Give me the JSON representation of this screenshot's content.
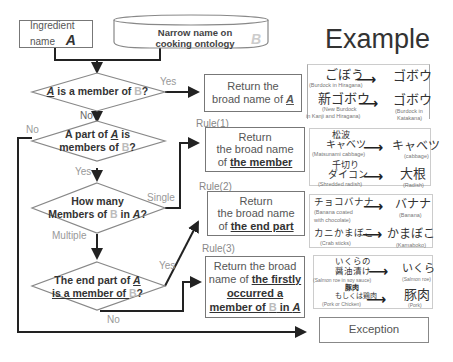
{
  "title": "Example",
  "inputs": {
    "ingredient": {
      "line1": "Ingredient",
      "line2": "name",
      "symbol": "A"
    },
    "ontology": {
      "line1": "Narrow name on",
      "line2": "cooking ontology",
      "symbol": "B"
    }
  },
  "decisions": {
    "d1": {
      "pre": "",
      "a": "A",
      "mid": " is a member of ",
      "b": "B",
      "post": "?"
    },
    "d2": {
      "line1_pre": "A part of ",
      "line1_a": "A",
      "line1_post": " is",
      "line2_pre": "members of ",
      "line2_b": "B",
      "line2_post": "?"
    },
    "d3": {
      "line1": "How many",
      "line2_pre": "Members of ",
      "line2_b": "B",
      "line2_mid": " in ",
      "line2_a": "A",
      "line2_post": "?"
    },
    "d4": {
      "line1_pre": "The end part of ",
      "line1_a": "A",
      "line2_pre": "is a member of ",
      "line2_b": "B",
      "line2_post": "?"
    }
  },
  "edge_labels": {
    "d1_yes": "Yes",
    "d1_no": "No",
    "d2_no": "No",
    "d2_yes": "Yes",
    "d3_single": "Single",
    "d3_multiple": "Multiple",
    "d4_yes": "Yes",
    "d4_no": "No"
  },
  "results": {
    "r0": {
      "line1": "Return the",
      "line2_pre": "broad name of ",
      "line2_a": "A"
    },
    "r1": {
      "rule": "Rule(1)",
      "line1": "Return",
      "line2": "the broad name",
      "line3_pre": "of ",
      "line3_bold": "the member"
    },
    "r2": {
      "rule": "Rule(2)",
      "line1": "Return",
      "line2": "the broad name",
      "line3_pre": "of ",
      "line3_bold": "the end part"
    },
    "r3": {
      "rule": "Rule(3)",
      "line1": "Return the broad",
      "line2_pre": "name of ",
      "line2_bold": "the firstly",
      "line3_bold": "occurred a",
      "line4_bold_pre": "member of ",
      "line4_b": "B",
      "line4_bold_mid": " in ",
      "line4_a": "A"
    },
    "exception": "Exception"
  },
  "examples": {
    "e0": [
      {
        "from": "ごぼう",
        "from_cap": "(Burdock in Hiragana)",
        "to": "ゴボウ",
        "to_cap": ""
      },
      {
        "from": "新ゴボウ",
        "from_cap": "(New Burdock",
        "from_cap2": "in Kanji and Hiragana)",
        "to": "ゴボウ",
        "to_cap": "(Burdock in",
        "to_cap2": "Katakana)"
      }
    ],
    "e1": [
      {
        "from": "松波",
        "from2": "キャベツ",
        "from_cap": "(Matsunami cabbage)",
        "to": "キャベツ",
        "to_cap": "(cabbage)"
      },
      {
        "from": "千切り",
        "from2": "ダイコン",
        "from_cap": "(Shredded radish)",
        "to": "大根",
        "to_cap": "(Radish)"
      }
    ],
    "e2": [
      {
        "from": "チョコバナナ",
        "from_cap": "(Banana coated",
        "from_cap2": "with chocolate)",
        "to": "バナナ",
        "to_cap": "(Banana)"
      },
      {
        "from": "カニかまぼこ",
        "from_cap": "(Crab sticks)",
        "to": "かまぼこ",
        "to_cap": "(Kamaboko)"
      }
    ],
    "e3": [
      {
        "from": "いくらの",
        "from2": "醤油漬け",
        "from_cap": "(Salmon roe in soy sauce)",
        "to": "いくら",
        "to_cap": "(Salmon roe)"
      },
      {
        "from": "豚肉",
        "from2": "もしくは鶏肉",
        "from_cap": "(Pork or Chicken)",
        "to": "豚肉",
        "to_cap": "(Pork)"
      }
    ]
  },
  "arrow_glyph": "⟶",
  "colors": {
    "line": "#222222",
    "box_border": "#777777",
    "text": "#444444",
    "muted": "#999999",
    "b_symbol": "#bbbbbb"
  }
}
